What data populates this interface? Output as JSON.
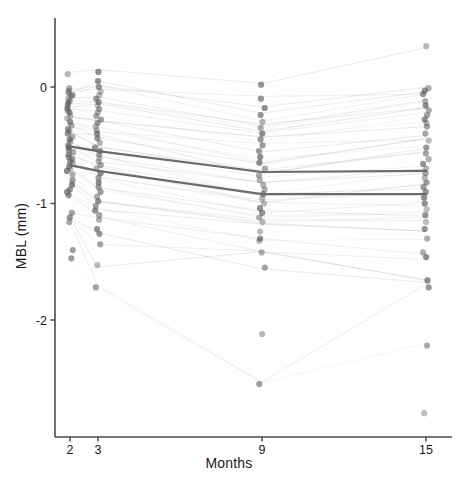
{
  "chart_data": {
    "type": "scatter",
    "title": "",
    "xlabel": "Months",
    "ylabel": "MBL (mm)",
    "x_tick_labels": [
      "2",
      "3",
      "9",
      "15"
    ],
    "x_tick_values": [
      2,
      3,
      9,
      15
    ],
    "y_tick_labels": [
      "0",
      "-1",
      "-2"
    ],
    "y_tick_values": [
      0,
      -1,
      -2
    ],
    "xlim": [
      1.4,
      16.2
    ],
    "ylim": [
      -2.95,
      0.42
    ],
    "grid": false,
    "legend": null,
    "point_color": "#555555",
    "point_opacity": 0.55,
    "point_radius": 3.1,
    "connector_color": "#9a9a9a",
    "connector_opacity": 0.28,
    "mean_line_color": "#6b6b6b",
    "mean_line_width": 2.2,
    "axis_color": "#4d4d4d",
    "series": [
      {
        "name": "Group mean A (upper)",
        "x": [
          2,
          3,
          9,
          15
        ],
        "values": [
          -0.51,
          -0.55,
          -0.73,
          -0.72
        ]
      },
      {
        "name": "Group mean B (lower)",
        "x": [
          2,
          3,
          9,
          15
        ],
        "values": [
          -0.67,
          -0.72,
          -0.92,
          -0.92
        ]
      }
    ],
    "observations": {
      "x": [
        2,
        3,
        9,
        15
      ],
      "month_2": [
        0.11,
        -0.01,
        -0.03,
        -0.05,
        -0.07,
        -0.08,
        -0.1,
        -0.12,
        -0.14,
        -0.16,
        -0.18,
        -0.2,
        -0.22,
        -0.25,
        -0.27,
        -0.3,
        -0.33,
        -0.36,
        -0.38,
        -0.4,
        -0.43,
        -0.45,
        -0.47,
        -0.5,
        -0.52,
        -0.54,
        -0.56,
        -0.58,
        -0.6,
        -0.62,
        -0.64,
        -0.66,
        -0.68,
        -0.7,
        -0.72,
        -0.75,
        -0.8,
        -0.84,
        -0.88,
        -0.9,
        -0.93,
        -1.08,
        -1.12,
        -1.16,
        -1.4,
        -1.47
      ],
      "month_3": [
        0.13,
        0.05,
        0.0,
        -0.04,
        -0.07,
        -0.1,
        -0.13,
        -0.16,
        -0.19,
        -0.22,
        -0.25,
        -0.28,
        -0.31,
        -0.34,
        -0.37,
        -0.4,
        -0.44,
        -0.48,
        -0.52,
        -0.55,
        -0.58,
        -0.61,
        -0.64,
        -0.67,
        -0.7,
        -0.74,
        -0.78,
        -0.82,
        -0.86,
        -0.9,
        -0.94,
        -0.98,
        -1.02,
        -1.06,
        -1.1,
        -1.14,
        -1.22,
        -1.26,
        -1.35,
        -1.53,
        -1.72
      ],
      "month_9": [
        0.02,
        -0.1,
        -0.18,
        -0.24,
        -0.3,
        -0.35,
        -0.4,
        -0.45,
        -0.5,
        -0.55,
        -0.6,
        -0.65,
        -0.7,
        -0.76,
        -0.8,
        -0.84,
        -0.88,
        -0.92,
        -0.96,
        -1.0,
        -1.04,
        -1.08,
        -1.12,
        -1.16,
        -1.24,
        -1.3,
        -1.32,
        -1.42,
        -1.55,
        -2.12,
        -2.55
      ],
      "month_15": [
        0.35,
        -0.01,
        -0.03,
        -0.06,
        -0.12,
        -0.16,
        -0.2,
        -0.24,
        -0.28,
        -0.31,
        -0.34,
        -0.4,
        -0.46,
        -0.52,
        -0.57,
        -0.62,
        -0.66,
        -0.7,
        -0.74,
        -0.78,
        -0.82,
        -0.86,
        -0.9,
        -0.95,
        -1.0,
        -1.05,
        -1.1,
        -1.16,
        -1.22,
        -1.3,
        -1.42,
        -1.46,
        -1.66,
        -1.72,
        -2.22,
        -2.8
      ]
    }
  },
  "axis": {
    "x_title": "Months",
    "y_title": "MBL (mm)"
  }
}
